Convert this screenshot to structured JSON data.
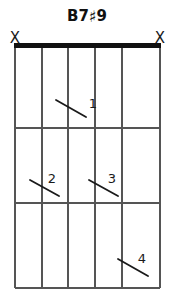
{
  "diagram": {
    "type": "guitar-chord-diagram",
    "title": "B7",
    "title_accidental": "♯",
    "title_extension": "9",
    "title_full": "B7♯9",
    "instrument": "guitar",
    "string_count": 6,
    "fret_count": 3,
    "has_nut": true,
    "colors": {
      "line": "#555555",
      "nut": "#111111",
      "text": "#1a1a1a",
      "background": "#ffffff"
    },
    "geometry": {
      "left": 15,
      "right": 160,
      "top": 48,
      "bottom": 288,
      "string_x": [
        15,
        42,
        68,
        95,
        122,
        160
      ],
      "fret_y": [
        48,
        128,
        203,
        288
      ],
      "nut_thickness": 5
    },
    "open_mute_markers": [
      {
        "label": "X",
        "symbol": "mute-x-icon",
        "string": 1,
        "x": 15,
        "y": 38
      },
      {
        "label": "X",
        "symbol": "mute-x-icon",
        "string": 6,
        "x": 160,
        "y": 38
      }
    ],
    "finger_markers": [
      {
        "finger": "1",
        "string": 3,
        "fret": 1,
        "slash_x1": 56,
        "slash_y1": 100,
        "slash_x2": 86,
        "slash_y2": 117,
        "label_x": 93,
        "label_y": 103
      },
      {
        "finger": "2",
        "string": 2,
        "fret": 2,
        "slash_x1": 30,
        "slash_y1": 180,
        "slash_x2": 59,
        "slash_y2": 196,
        "label_x": 52,
        "label_y": 178
      },
      {
        "finger": "3",
        "string": 4,
        "fret": 2,
        "slash_x1": 89,
        "slash_y1": 180,
        "slash_x2": 118,
        "slash_y2": 196,
        "label_x": 112,
        "label_y": 178
      },
      {
        "finger": "4",
        "string": 5,
        "fret": 3,
        "slash_x1": 118,
        "slash_y1": 259,
        "slash_x2": 148,
        "slash_y2": 276,
        "label_x": 142,
        "label_y": 258
      }
    ]
  }
}
